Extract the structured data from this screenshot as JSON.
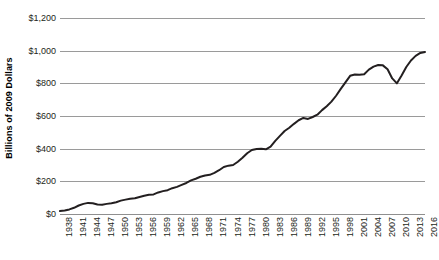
{
  "chart_data": {
    "type": "line",
    "title": "",
    "xlabel": "",
    "ylabel": "Billions of 2009 Dollars",
    "ylim": [
      0,
      1200
    ],
    "ytick_labels": [
      "$1,200",
      "$1,000",
      "$800",
      "$600",
      "$400",
      "$200",
      "$0"
    ],
    "ytick_values": [
      1200,
      1000,
      800,
      600,
      400,
      200,
      0
    ],
    "xlim": [
      1938,
      2016
    ],
    "xtick_labels": [
      "1938",
      "1941",
      "1944",
      "1947",
      "1950",
      "1953",
      "1956",
      "1959",
      "1962",
      "1965",
      "1968",
      "1971",
      "1974",
      "1977",
      "1980",
      "1983",
      "1986",
      "1989",
      "1992",
      "1995",
      "1998",
      "2001",
      "2004",
      "2007",
      "2010",
      "2013",
      "2016"
    ],
    "xtick_values": [
      1938,
      1941,
      1944,
      1947,
      1950,
      1953,
      1956,
      1959,
      1962,
      1965,
      1968,
      1971,
      1974,
      1977,
      1980,
      1983,
      1986,
      1989,
      1992,
      1995,
      1998,
      2001,
      2004,
      2007,
      2010,
      2013,
      2016
    ],
    "grid": "horizontal",
    "legend": "none",
    "line_color": "#231f20",
    "line_width": 2,
    "x": [
      1938,
      1939,
      1940,
      1941,
      1942,
      1943,
      1944,
      1945,
      1946,
      1947,
      1948,
      1949,
      1950,
      1951,
      1952,
      1953,
      1954,
      1955,
      1956,
      1957,
      1958,
      1959,
      1960,
      1961,
      1962,
      1963,
      1964,
      1965,
      1966,
      1967,
      1968,
      1969,
      1970,
      1971,
      1972,
      1973,
      1974,
      1975,
      1976,
      1977,
      1978,
      1979,
      1980,
      1981,
      1982,
      1983,
      1984,
      1985,
      1986,
      1987,
      1988,
      1989,
      1990,
      1991,
      1992,
      1993,
      1994,
      1995,
      1996,
      1997,
      1998,
      1999,
      2000,
      2001,
      2002,
      2003,
      2004,
      2005,
      2006,
      2007,
      2008,
      2009,
      2010,
      2011,
      2012,
      2013,
      2014,
      2015,
      2016
    ],
    "values": [
      18,
      22,
      28,
      38,
      52,
      62,
      68,
      66,
      58,
      56,
      62,
      66,
      72,
      82,
      88,
      94,
      96,
      104,
      112,
      118,
      120,
      132,
      140,
      146,
      158,
      166,
      178,
      190,
      206,
      216,
      228,
      236,
      240,
      252,
      268,
      288,
      296,
      300,
      320,
      344,
      372,
      392,
      398,
      400,
      396,
      412,
      448,
      478,
      508,
      528,
      552,
      574,
      588,
      582,
      594,
      608,
      636,
      660,
      688,
      724,
      766,
      806,
      846,
      854,
      852,
      856,
      884,
      902,
      912,
      910,
      886,
      830,
      800,
      848,
      900,
      940,
      968,
      986,
      992
    ]
  }
}
